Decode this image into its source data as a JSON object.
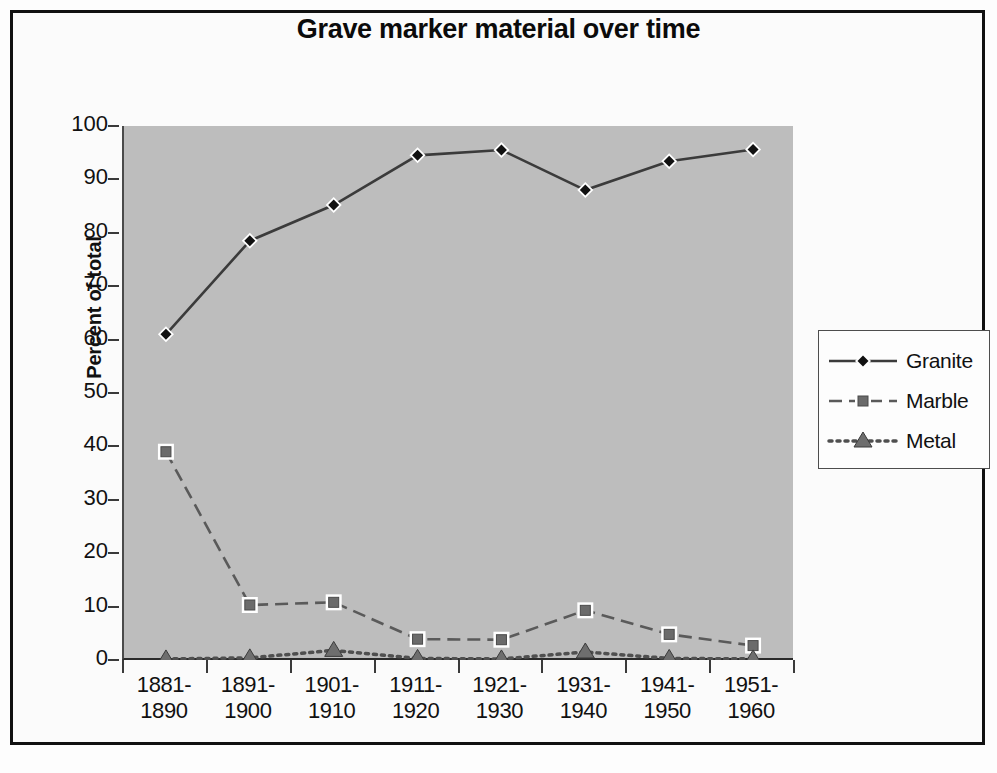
{
  "chart_data": {
    "type": "line",
    "title": "Grave marker material over time",
    "xlabel": "",
    "ylabel": "Percent of total",
    "ylim": [
      0,
      100
    ],
    "ytick_step": 10,
    "yticks": [
      100,
      90,
      80,
      70,
      60,
      50,
      40,
      30,
      20,
      10,
      0
    ],
    "grid": false,
    "legend_position": "right",
    "categories": [
      "1881-1890",
      "1891-1900",
      "1901-1910",
      "1911-1920",
      "1921-1930",
      "1931-1940",
      "1941-1950",
      "1951-1960"
    ],
    "category_lines": [
      [
        "1881-",
        "1890"
      ],
      [
        "1891-",
        "1900"
      ],
      [
        "1901-",
        "1910"
      ],
      [
        "1911-",
        "1920"
      ],
      [
        "1921-",
        "1930"
      ],
      [
        "1931-",
        "1940"
      ],
      [
        "1941-",
        "1950"
      ],
      [
        "1951-",
        "1960"
      ]
    ],
    "series": [
      {
        "name": "Granite",
        "marker": "diamond",
        "line_style": "solid",
        "color": "#3b3b3b",
        "values": [
          61.0,
          78.5,
          85.2,
          94.5,
          95.5,
          88.0,
          93.4,
          95.6
        ]
      },
      {
        "name": "Marble",
        "marker": "square",
        "line_style": "dashed",
        "color": "#5a5a5a",
        "values": [
          39.0,
          10.3,
          10.8,
          3.9,
          3.8,
          9.3,
          4.8,
          2.7
        ]
      },
      {
        "name": "Metal",
        "marker": "triangle",
        "line_style": "dotted",
        "color": "#4f4f4f",
        "values": [
          0.2,
          0.4,
          1.8,
          0.3,
          0.2,
          1.5,
          0.3,
          0.2
        ]
      }
    ]
  },
  "legend": {
    "items": [
      {
        "label": "Granite"
      },
      {
        "label": "Marble"
      },
      {
        "label": "Metal"
      }
    ]
  },
  "colors": {
    "plot_background": "#bdbdbd",
    "page_background": "#fdfdfd",
    "frame_border": "#111111",
    "axis": "#2b2b2b"
  }
}
